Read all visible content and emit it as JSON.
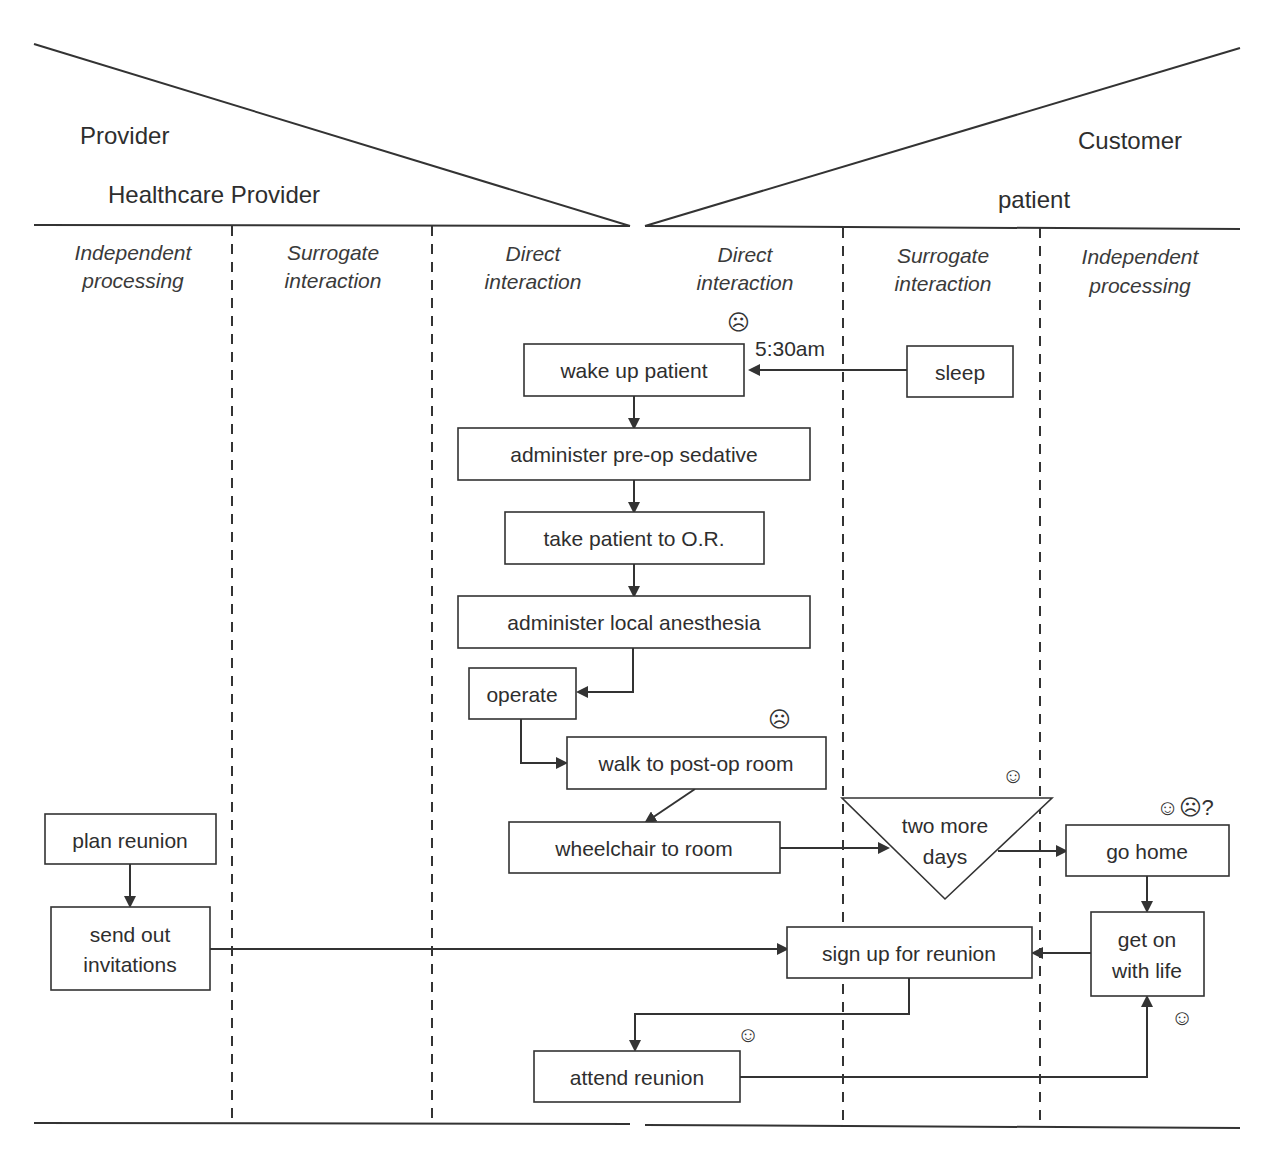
{
  "header": {
    "left": {
      "title": "Provider",
      "subtitle": "Healthcare Provider"
    },
    "right": {
      "title": "Customer",
      "subtitle": "patient"
    }
  },
  "columns": [
    {
      "label_line1": "Independent",
      "label_line2": "processing"
    },
    {
      "label_line1": "Surrogate",
      "label_line2": "interaction"
    },
    {
      "label_line1": "Direct",
      "label_line2": "interaction"
    },
    {
      "label_line1": "Direct",
      "label_line2": "interaction"
    },
    {
      "label_line1": "Surrogate",
      "label_line2": "interaction"
    },
    {
      "label_line1": "Independent",
      "label_line2": "processing"
    }
  ],
  "nodes": {
    "wake_up": "wake up patient",
    "sleep": "sleep",
    "sedative": "administer pre-op sedative",
    "to_or": "take patient to O.R.",
    "anesthesia": "administer local anesthesia",
    "operate": "operate",
    "walk": "walk to post-op room",
    "wheelchair": "wheelchair to room",
    "two_more_line1": "two more",
    "two_more_line2": "days",
    "go_home": "go home",
    "plan_reunion": "plan reunion",
    "send_out_line1": "send out",
    "send_out_line2": "invitations",
    "sign_up": "sign up for reunion",
    "get_on_line1": "get on",
    "get_on_line2": "with life",
    "attend": "attend reunion"
  },
  "annotations": {
    "time": "5:30am",
    "frown_wake": "☹",
    "frown_walk": "☹",
    "smile_two_days": "☺",
    "go_home_mood": "☺☹?",
    "smile_get_on": "☺",
    "smile_attend": "☺"
  }
}
